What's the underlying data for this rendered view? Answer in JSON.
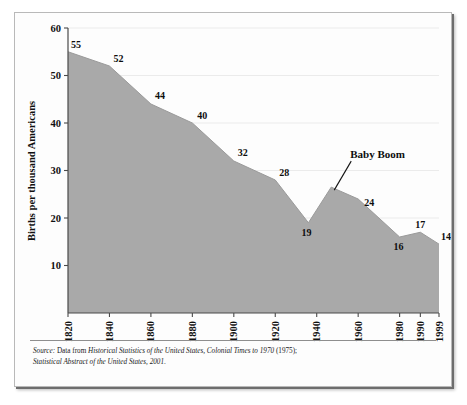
{
  "figure": {
    "y_axis_title": "Births per thousand Americans",
    "source_lead": "Source:",
    "source_line1_pre": " Data from ",
    "source_line1_italic": "Historical Statistics of the United States, Colonial Times to 1970",
    "source_line1_post": " (1975);",
    "source_line2_italic": "Statistical Abstract of the United States, 2001",
    "source_line2_post": ".",
    "annotation": "Baby Boom",
    "fill_color": "#a9a9a9",
    "gridline_color": "#ebebeb",
    "axis_color": "#4a4a4a"
  },
  "chart_data": {
    "type": "area",
    "title": "",
    "xlabel": "",
    "ylabel": "Births per thousand Americans",
    "xlim": [
      1820,
      1999
    ],
    "ylim": [
      0,
      60
    ],
    "ytick_values": [
      10,
      20,
      30,
      40,
      50,
      60
    ],
    "ytick_labels": [
      "10",
      "20",
      "30",
      "40",
      "50",
      "60"
    ],
    "xtick_values": [
      1820,
      1840,
      1860,
      1880,
      1900,
      1920,
      1940,
      1960,
      1980,
      1990,
      1999
    ],
    "xtick_labels": [
      "1820",
      "1840",
      "1860",
      "1880",
      "1900",
      "1920",
      "1940",
      "1960",
      "1980",
      "1990",
      "1999"
    ],
    "grid": true,
    "legend": "none",
    "x": [
      1820,
      1840,
      1860,
      1880,
      1900,
      1920,
      1936,
      1947,
      1960,
      1980,
      1990,
      1999
    ],
    "y": [
      55,
      52,
      44,
      40,
      32,
      28,
      19,
      26.5,
      24,
      16,
      17,
      14.5
    ],
    "point_labels": [
      {
        "x": 1820,
        "y": 55,
        "text": "55"
      },
      {
        "x": 1840,
        "y": 52,
        "text": "52"
      },
      {
        "x": 1860,
        "y": 44,
        "text": "44"
      },
      {
        "x": 1880,
        "y": 40,
        "text": "40"
      },
      {
        "x": 1900,
        "y": 32,
        "text": "32"
      },
      {
        "x": 1920,
        "y": 28,
        "text": "28"
      },
      {
        "x": 1936,
        "y": 19,
        "text": "19"
      },
      {
        "x": 1960,
        "y": 24,
        "text": "24"
      },
      {
        "x": 1980,
        "y": 16,
        "text": "16"
      },
      {
        "x": 1990,
        "y": 17,
        "text": "17"
      },
      {
        "x": 1999,
        "y": 14.5,
        "text": "14.5"
      }
    ],
    "annotations": [
      {
        "text": "Baby Boom",
        "points_to_x": 1947,
        "points_to_y": 26.5
      }
    ]
  }
}
